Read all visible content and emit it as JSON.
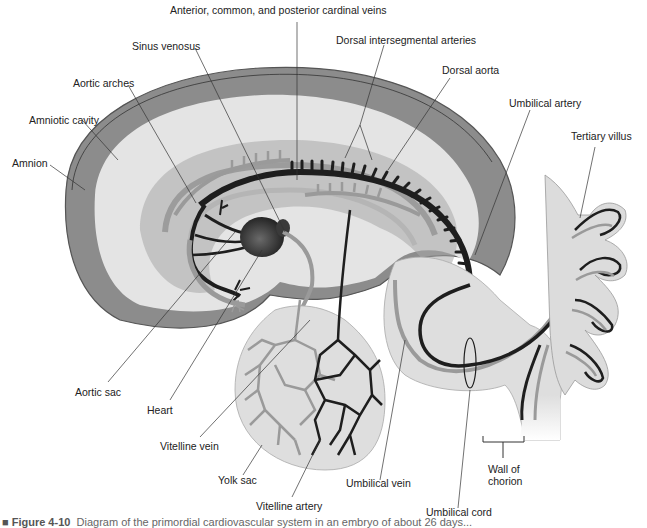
{
  "figure": {
    "type": "anatomical-diagram",
    "colors": {
      "amnion_band": "#8a8a8a",
      "amniotic_cavity": "#e6e6e6",
      "arteries": "#1e1e1e",
      "veins": "#9a9a9a",
      "yolk_sac": "#dcdcdc",
      "background": "#ffffff"
    }
  },
  "labels": {
    "cardinal_veins": "Anterior, common, and posterior cardinal veins",
    "sinus_venosus": "Sinus venosus",
    "dorsal_intersegmental_arteries": "Dorsal intersegmental arteries",
    "aortic_arches": "Aortic arches",
    "dorsal_aorta": "Dorsal aorta",
    "amniotic_cavity": "Amniotic cavity",
    "umbilical_artery": "Umbilical artery",
    "tertiary_villus": "Tertiary villus",
    "amnion": "Amnion",
    "aortic_sac": "Aortic sac",
    "heart": "Heart",
    "vitelline_vein": "Vitelline vein",
    "yolk_sac": "Yolk sac",
    "umbilical_vein": "Umbilical vein",
    "wall_of_chorion_line1": "Wall of",
    "wall_of_chorion_line2": "chorion",
    "vitelline_artery": "Vitelline artery",
    "umbilical_cord": "Umbilical cord"
  },
  "caption": {
    "prefix": "■ Figure 4-10",
    "text": "Diagram of the primordial cardiovascular system in an embryo of about 26 days..."
  }
}
